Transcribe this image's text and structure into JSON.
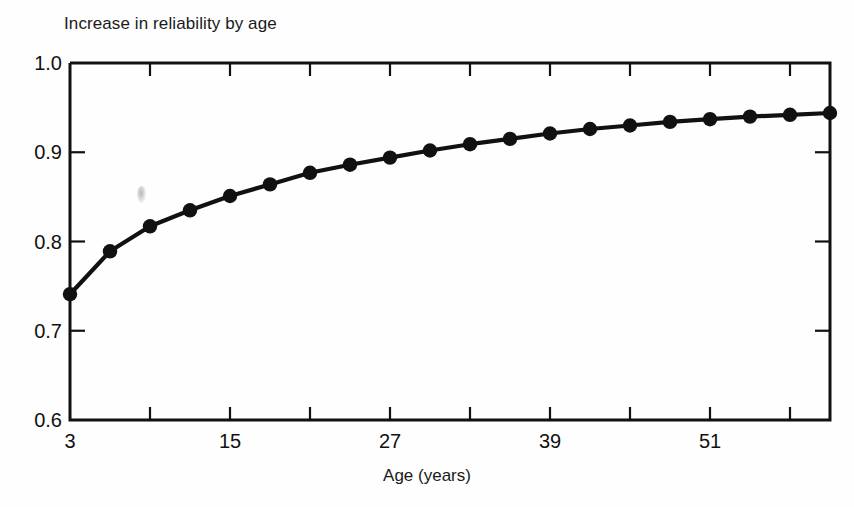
{
  "chart_data": {
    "type": "line",
    "title": "Increase in reliability by age",
    "xlabel": "Age (years)",
    "ylabel": "",
    "xlim": [
      3,
      60
    ],
    "ylim": [
      0.6,
      1.0
    ],
    "grid": false,
    "legend": null,
    "marker": "filled-circle",
    "x_tick_labels": [
      "3",
      "15",
      "27",
      "39",
      "51"
    ],
    "x_tick_values": [
      3,
      15,
      27,
      39,
      51
    ],
    "x_minor_tick_values": [
      9,
      21,
      33,
      45,
      57
    ],
    "y_tick_labels": [
      "0.6",
      "0.7",
      "0.8",
      "0.9",
      "1.0"
    ],
    "y_tick_values": [
      0.6,
      0.7,
      0.8,
      0.9,
      1.0
    ],
    "x": [
      3,
      6,
      9,
      12,
      15,
      18,
      21,
      24,
      27,
      30,
      33,
      36,
      39,
      42,
      45,
      48,
      51,
      54,
      57,
      60
    ],
    "values": [
      0.741,
      0.789,
      0.817,
      0.835,
      0.851,
      0.864,
      0.877,
      0.886,
      0.894,
      0.902,
      0.909,
      0.915,
      0.921,
      0.926,
      0.93,
      0.934,
      0.937,
      0.94,
      0.942,
      0.944
    ],
    "series": [
      {
        "name": "Increase in reliability by age",
        "color": "#111111",
        "values": [
          0.741,
          0.789,
          0.817,
          0.835,
          0.851,
          0.864,
          0.877,
          0.886,
          0.894,
          0.902,
          0.909,
          0.915,
          0.921,
          0.926,
          0.93,
          0.934,
          0.937,
          0.94,
          0.942,
          0.944
        ]
      }
    ]
  },
  "figure": {
    "title": "Increase in reliability by age",
    "xaxis_title": "Age (years)",
    "background_color": "#fefefe",
    "line_color": "#111111",
    "axis_color": "#111111"
  }
}
